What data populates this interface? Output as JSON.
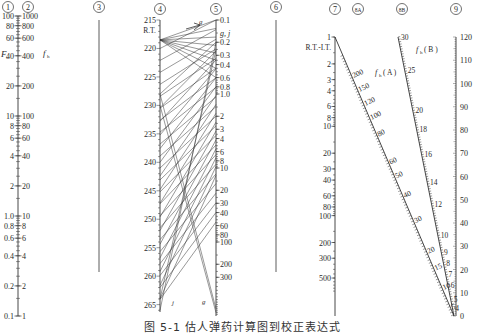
{
  "figure": {
    "caption": "图 5-1  估人弹药计算图到校正表达式"
  },
  "axes": [
    {
      "id": "1",
      "circle_label": "①",
      "x": 18,
      "y_top": 12,
      "y_bottom": 316,
      "variable": "F",
      "variable_side": "left",
      "scale": "log",
      "range": [
        0.1,
        100
      ],
      "ticks_left": [
        {
          "v": 100,
          "label": "100"
        },
        {
          "v": 80,
          "label": "80"
        },
        {
          "v": 60,
          "label": "60"
        },
        {
          "v": 40,
          "label": "40"
        },
        {
          "v": 20,
          "label": "20"
        },
        {
          "v": 10,
          "label": "10"
        },
        {
          "v": 8,
          "label": "8"
        },
        {
          "v": 6,
          "label": "6"
        },
        {
          "v": 4,
          "label": "4"
        },
        {
          "v": 2,
          "label": "2"
        },
        {
          "v": 1.0,
          "label": "1.0"
        },
        {
          "v": 0.8,
          "label": "0.8"
        },
        {
          "v": 0.6,
          "label": "0.6"
        },
        {
          "v": 0.4,
          "label": "0.4"
        },
        {
          "v": 0.2,
          "label": "0.2"
        },
        {
          "v": 0.1,
          "label": "0.1"
        }
      ]
    },
    {
      "id": "2",
      "circle_label": "②",
      "x": 18,
      "variable": "fh",
      "variable_side": "right",
      "scale": "log",
      "range": [
        1,
        1000
      ],
      "ticks_right": [
        "1000",
        "800",
        "600",
        "400",
        "200",
        "100",
        "80",
        "60",
        "40",
        "20",
        "10",
        "8",
        "6",
        "4",
        "2",
        "1"
      ]
    },
    {
      "id": "3",
      "circle_label": "③",
      "x": 99,
      "y_top": 20,
      "y_bottom": 272,
      "note": "blank reference line"
    },
    {
      "id": "4",
      "circle_label": "④",
      "x": 160,
      "y_top": 20,
      "y_bottom": 312,
      "variable": "R.T.",
      "scale": "linear",
      "range": [
        215,
        267
      ],
      "ticks_left": [
        "215",
        "R.T.",
        "220",
        "225",
        "230",
        "235",
        "240",
        "245",
        "250",
        "255",
        "260",
        "265"
      ]
    },
    {
      "id": "5",
      "circle_label": "⑤",
      "x": 216,
      "y_top": 20,
      "y_bottom": 316,
      "variable": "g, j",
      "scale": "log",
      "range": [
        0.1,
        1000
      ],
      "ticks_right": [
        "0.1",
        "0.2",
        "0.3",
        "0.4",
        "0.6",
        "0.8",
        "1.0",
        "2",
        "3",
        "4",
        "6",
        "8",
        "10",
        "20",
        "30",
        "40",
        "60",
        "80",
        "100",
        "200",
        "300"
      ]
    },
    {
      "id": "6",
      "circle_label": "⑥",
      "x": 276,
      "y_top": 20,
      "y_bottom": 272,
      "note": "blank reference line"
    },
    {
      "id": "7",
      "circle_label": "⑦",
      "x": 335,
      "y_top": 20,
      "y_bottom": 296,
      "variable": "R.T.-I.T.",
      "scale": "log",
      "range": [
        1,
        1000
      ],
      "ticks_left": [
        "1",
        "2",
        "3",
        "4",
        "6",
        "8",
        "10",
        "20",
        "30",
        "40",
        "60",
        "80",
        "100",
        "200",
        "300",
        "500"
      ]
    },
    {
      "id": "8A",
      "circle_label": "8A",
      "variable": "fh (A)",
      "from": [
        335,
        37
      ],
      "to": [
        454,
        316
      ],
      "ticks_right": [
        "200",
        "150",
        "120",
        "100",
        "80",
        "60",
        "50",
        "40",
        "30",
        "20",
        "15",
        "10",
        "5"
      ]
    },
    {
      "id": "8B",
      "circle_label": "8B",
      "variable": "fh (B)",
      "from": [
        398,
        37
      ],
      "to": [
        454,
        316
      ],
      "ticks_right": [
        "30",
        "25",
        "20",
        "18",
        "16",
        "14",
        "12",
        "10",
        "9",
        "8",
        "7",
        "6",
        "5",
        "4",
        "3",
        "2"
      ]
    },
    {
      "id": "9",
      "circle_label": "⑨",
      "x": 456,
      "y_top": 37,
      "y_bottom": 316,
      "scale": "linear",
      "range": [
        0,
        120
      ],
      "ticks_right": [
        "120",
        "110",
        "100",
        "90",
        "80",
        "70",
        "60",
        "50",
        "40",
        "30",
        "20",
        "10",
        "0"
      ]
    }
  ],
  "annotations": {
    "axis5_top_marker": "g",
    "axis4_bottom_marker": "j",
    "axis5_bottom_marker": "g"
  }
}
